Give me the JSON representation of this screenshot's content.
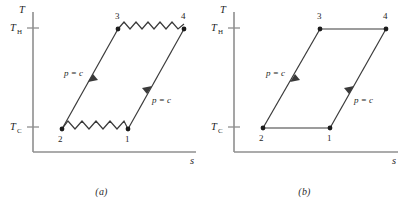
{
  "figure": {
    "type": "thermodynamic-Ts-diagram",
    "panels": [
      {
        "caption": "(a)",
        "axes": {
          "y_label": "T",
          "x_label": "s",
          "y_ticks": [
            {
              "label": "T",
              "sub": "H",
              "value": "T_H"
            },
            {
              "label": "T",
              "sub": "C",
              "value": "T_C"
            }
          ]
        },
        "states": [
          {
            "id": "1",
            "label": "1",
            "temperature": "T_C"
          },
          {
            "id": "2",
            "label": "2",
            "temperature": "T_C"
          },
          {
            "id": "3",
            "label": "3",
            "temperature": "T_H"
          },
          {
            "id": "4",
            "label": "4",
            "temperature": "T_H"
          }
        ],
        "processes": [
          {
            "from": "2",
            "to": "3",
            "label": "p = c",
            "style": "straight-line-with-arrow"
          },
          {
            "from": "4",
            "to": "1",
            "label": "p = c",
            "style": "straight-line-with-arrow"
          },
          {
            "from": "2",
            "to": "1",
            "label": "",
            "style": "zigzag",
            "zigzag_peaks": 5
          },
          {
            "from": "3",
            "to": "4",
            "label": "",
            "style": "zigzag",
            "zigzag_peaks": 7
          }
        ]
      },
      {
        "caption": "(b)",
        "axes": {
          "y_label": "T",
          "x_label": "s",
          "y_ticks": [
            {
              "label": "T",
              "sub": "H",
              "value": "T_H"
            },
            {
              "label": "T",
              "sub": "C",
              "value": "T_C"
            }
          ]
        },
        "states": [
          {
            "id": "1",
            "label": "1",
            "temperature": "T_C"
          },
          {
            "id": "2",
            "label": "2",
            "temperature": "T_C"
          },
          {
            "id": "3",
            "label": "3",
            "temperature": "T_H"
          },
          {
            "id": "4",
            "label": "4",
            "temperature": "T_H"
          }
        ],
        "processes": [
          {
            "from": "2",
            "to": "3",
            "label": "p = c",
            "style": "straight-line-with-arrow"
          },
          {
            "from": "4",
            "to": "1",
            "label": "p = c",
            "style": "straight-line-with-arrow"
          },
          {
            "from": "2",
            "to": "1",
            "label": "",
            "style": "straight-line"
          },
          {
            "from": "3",
            "to": "4",
            "label": "",
            "style": "straight-line"
          }
        ]
      }
    ],
    "colors": {
      "line": "#3a3a3a",
      "axis": "#8f8f8f",
      "text": "#262626",
      "background": "#ffffff"
    }
  }
}
